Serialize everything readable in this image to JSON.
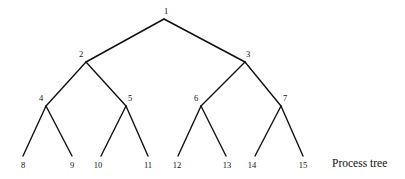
{
  "figure": {
    "caption": "Process tree",
    "caption_x": 332,
    "caption_y": 158,
    "background_color": "#ffffff",
    "line_color": "#111111",
    "text_color": "#111111"
  },
  "chart_data": {
    "type": "diagram",
    "title": "Process tree",
    "diagram_kind": "binary-tree",
    "node_count": 15,
    "depth": 4,
    "nodes": [
      {
        "id": "1",
        "label": "1",
        "x": 164,
        "y": 19,
        "label_x": 166,
        "label_y": 11,
        "level": 0,
        "parent": null
      },
      {
        "id": "2",
        "label": "2",
        "x": 86,
        "y": 62,
        "label_x": 81,
        "label_y": 54,
        "level": 1,
        "parent": "1"
      },
      {
        "id": "3",
        "label": "3",
        "x": 245,
        "y": 62,
        "label_x": 248,
        "label_y": 54,
        "level": 1,
        "parent": "1"
      },
      {
        "id": "4",
        "label": "4",
        "x": 46,
        "y": 106,
        "label_x": 41,
        "label_y": 98,
        "level": 2,
        "parent": "2"
      },
      {
        "id": "5",
        "label": "5",
        "x": 126,
        "y": 106,
        "label_x": 130,
        "label_y": 98,
        "level": 2,
        "parent": "2"
      },
      {
        "id": "6",
        "label": "6",
        "x": 201,
        "y": 106,
        "label_x": 196,
        "label_y": 98,
        "level": 2,
        "parent": "3"
      },
      {
        "id": "7",
        "label": "7",
        "x": 281,
        "y": 106,
        "label_x": 285,
        "label_y": 98,
        "level": 2,
        "parent": "3"
      },
      {
        "id": "8",
        "label": "8",
        "x": 23,
        "y": 156,
        "label_x": 23,
        "label_y": 165,
        "level": 3,
        "parent": "4"
      },
      {
        "id": "9",
        "label": "9",
        "x": 72,
        "y": 156,
        "label_x": 72,
        "label_y": 165,
        "level": 3,
        "parent": "4"
      },
      {
        "id": "10",
        "label": "10",
        "x": 101,
        "y": 156,
        "label_x": 98,
        "label_y": 165,
        "level": 3,
        "parent": "5"
      },
      {
        "id": "11",
        "label": "11",
        "x": 148,
        "y": 156,
        "label_x": 148,
        "label_y": 165,
        "level": 3,
        "parent": "5"
      },
      {
        "id": "12",
        "label": "12",
        "x": 178,
        "y": 156,
        "label_x": 177,
        "label_y": 165,
        "level": 3,
        "parent": "6"
      },
      {
        "id": "13",
        "label": "13",
        "x": 226,
        "y": 156,
        "label_x": 227,
        "label_y": 165,
        "level": 3,
        "parent": "6"
      },
      {
        "id": "14",
        "label": "14",
        "x": 255,
        "y": 156,
        "label_x": 252,
        "label_y": 165,
        "level": 3,
        "parent": "7"
      },
      {
        "id": "15",
        "label": "15",
        "x": 303,
        "y": 156,
        "label_x": 303,
        "label_y": 165,
        "level": 3,
        "parent": "7"
      }
    ],
    "edges": [
      {
        "from": "1",
        "to": "2"
      },
      {
        "from": "1",
        "to": "3"
      },
      {
        "from": "2",
        "to": "4"
      },
      {
        "from": "2",
        "to": "5"
      },
      {
        "from": "3",
        "to": "6"
      },
      {
        "from": "3",
        "to": "7"
      },
      {
        "from": "4",
        "to": "8"
      },
      {
        "from": "4",
        "to": "9"
      },
      {
        "from": "5",
        "to": "10"
      },
      {
        "from": "5",
        "to": "11"
      },
      {
        "from": "6",
        "to": "12"
      },
      {
        "from": "6",
        "to": "13"
      },
      {
        "from": "7",
        "to": "14"
      },
      {
        "from": "7",
        "to": "15"
      }
    ]
  }
}
